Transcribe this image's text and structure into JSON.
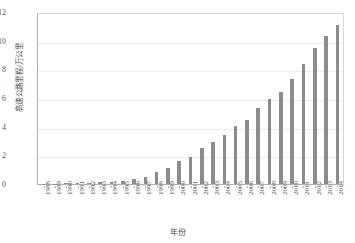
{
  "chart_data": {
    "type": "bar",
    "title": "",
    "xlabel": "年份",
    "ylabel": "高速公路里程/万公里",
    "ylim": [
      0,
      12
    ],
    "yticks": [
      12,
      10,
      8,
      6,
      4,
      2,
      0
    ],
    "grid": true,
    "legend": null,
    "bar_color": "#8c8c8c",
    "categories": [
      "1988",
      "1989",
      "1990",
      "1991",
      "1992",
      "1993",
      "1994",
      "1995",
      "1996",
      "1997",
      "1998",
      "1999",
      "2000",
      "2001",
      "2002",
      "2003",
      "2004",
      "2005",
      "2006",
      "2007",
      "2008",
      "2009",
      "2010",
      "2011",
      "2012",
      "2013",
      "2014"
    ],
    "values": [
      0.01,
      0.03,
      0.05,
      0.06,
      0.07,
      0.11,
      0.16,
      0.21,
      0.34,
      0.48,
      0.86,
      1.16,
      1.63,
      1.94,
      2.51,
      2.97,
      3.43,
      4.1,
      4.53,
      5.39,
      6.03,
      6.51,
      7.41,
      8.49,
      9.62,
      10.44,
      11.19
    ]
  }
}
